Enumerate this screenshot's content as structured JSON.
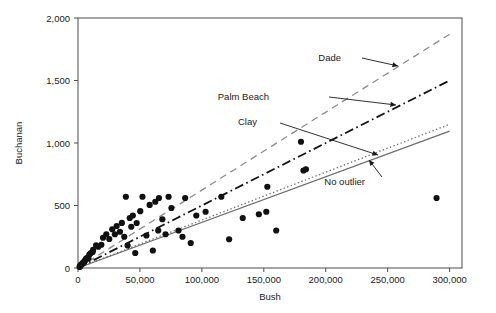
{
  "chart_data": {
    "type": "scatter",
    "title": "",
    "xlabel": "Bush",
    "ylabel": "Buchanan",
    "xlim": [
      0,
      310000
    ],
    "ylim": [
      0,
      2000
    ],
    "grid": false,
    "legend_position": "none",
    "xticks": [
      0,
      50000,
      100000,
      150000,
      200000,
      250000,
      300000
    ],
    "xticklabels": [
      "0",
      "50,000",
      "100,000",
      "150,000",
      "200,000",
      "250,000",
      "300,000"
    ],
    "yticks": [
      0,
      500,
      1000,
      1500,
      2000
    ],
    "yticklabels": [
      "0",
      "500",
      "1,000",
      "1,500",
      "2,000"
    ],
    "points": [
      [
        1316,
        9
      ],
      [
        2873,
        29
      ],
      [
        5413,
        57
      ],
      [
        2146,
        22
      ],
      [
        3748,
        36
      ],
      [
        4985,
        46
      ],
      [
        1607,
        15
      ],
      [
        2448,
        26
      ],
      [
        6443,
        73
      ],
      [
        3704,
        38
      ],
      [
        8338,
        78
      ],
      [
        5058,
        52
      ],
      [
        9138,
        107
      ],
      [
        4051,
        41
      ],
      [
        7102,
        80
      ],
      [
        12176,
        145
      ],
      [
        10395,
        120
      ],
      [
        14630,
        182
      ],
      [
        11847,
        128
      ],
      [
        16404,
        170
      ],
      [
        20196,
        242
      ],
      [
        18850,
        186
      ],
      [
        22846,
        270
      ],
      [
        25249,
        232
      ],
      [
        27646,
        310
      ],
      [
        29765,
        270
      ],
      [
        31214,
        336
      ],
      [
        33864,
        290
      ],
      [
        35419,
        361
      ],
      [
        37350,
        250
      ],
      [
        38637,
        570
      ],
      [
        41745,
        400
      ],
      [
        40048,
        180
      ],
      [
        44276,
        420
      ],
      [
        42985,
        330
      ],
      [
        47365,
        360
      ],
      [
        46210,
        120
      ],
      [
        52043,
        570
      ],
      [
        50260,
        455
      ],
      [
        55229,
        260
      ],
      [
        57830,
        505
      ],
      [
        60426,
        140
      ],
      [
        62392,
        530
      ],
      [
        65348,
        560
      ],
      [
        64765,
        300
      ],
      [
        68100,
        390
      ],
      [
        70677,
        270
      ],
      [
        73128,
        570
      ],
      [
        75398,
        480
      ],
      [
        81126,
        300
      ],
      [
        84338,
        250
      ],
      [
        86512,
        560
      ],
      [
        91000,
        200
      ],
      [
        95500,
        420
      ],
      [
        103000,
        450
      ],
      [
        115704,
        570
      ],
      [
        122000,
        230
      ],
      [
        133000,
        400
      ],
      [
        146000,
        430
      ],
      [
        152846,
        650
      ],
      [
        160000,
        300
      ],
      [
        180000,
        1010
      ],
      [
        182000,
        780
      ],
      [
        184000,
        790
      ],
      [
        152000,
        450
      ],
      [
        289456,
        560
      ]
    ],
    "point_color": "#111111",
    "lines": [
      {
        "name": "Dade",
        "style": "dashed",
        "color": "#8c8c8c",
        "x": [
          0,
          300000
        ],
        "y": [
          0,
          1870
        ],
        "label": "Dade",
        "label_x": 341,
        "label_y": 61,
        "arrow_from": [
          362,
          58
        ],
        "arrow_to": [
          398,
          66
        ]
      },
      {
        "name": "Palm Beach",
        "style": "dashdot",
        "color": "#141414",
        "x": [
          0,
          300000
        ],
        "y": [
          0,
          1500
        ],
        "label": "Palm Beach",
        "label_x": 269,
        "label_y": 100,
        "arrow_from": [
          329,
          97
        ],
        "arrow_to": [
          396,
          105
        ]
      },
      {
        "name": "Clay",
        "style": "dotted",
        "color": "#6e6e6e",
        "x": [
          0,
          300000
        ],
        "y": [
          0,
          1150
        ],
        "label": "Clay",
        "label_x": 257,
        "label_y": 125,
        "arrow_from": [
          280,
          123
        ],
        "arrow_to": [
          378,
          155
        ]
      },
      {
        "name": "No outlier",
        "style": "solid",
        "color": "#6e6e6e",
        "x": [
          0,
          300000
        ],
        "y": [
          0,
          1095
        ],
        "label": "No outlier",
        "label_x": 365,
        "label_y": 185,
        "arrow_from": [
          382,
          177
        ],
        "arrow_to": [
          369,
          160
        ]
      }
    ]
  }
}
